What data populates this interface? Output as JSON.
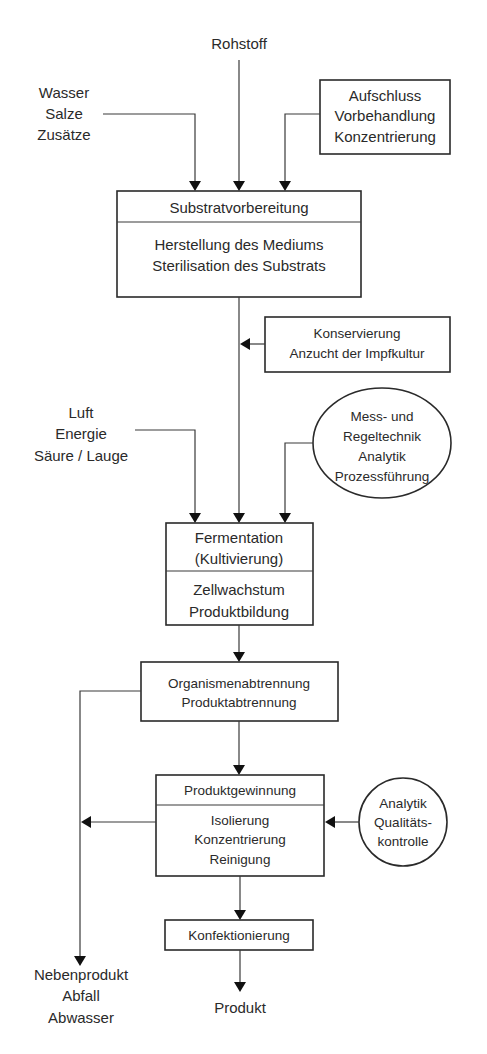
{
  "diagram": {
    "type": "process-flowchart",
    "colors": {
      "line": "#3a3a3a",
      "text": "#2a2a2a",
      "arrowhead": "#111111",
      "background": "#ffffff"
    },
    "inputs": {
      "rohstoff": "Rohstoff",
      "wasser_group": {
        "lines": [
          "Wasser",
          "Salze",
          "Zusätze"
        ]
      },
      "luft_group": {
        "lines": [
          "Luft",
          "Energie",
          "Säure / Lauge"
        ]
      }
    },
    "aufschluss_box": {
      "lines": [
        "Aufschluss",
        "Vorbehandlung",
        "Konzentrierung"
      ]
    },
    "substrat_box": {
      "header": "Substratvorbereitung",
      "lines": [
        "Herstellung des Mediums",
        "Sterilisation des Substrats"
      ]
    },
    "konservierung_box": {
      "lines": [
        "Konservierung",
        "Anzucht der Impfkultur"
      ]
    },
    "mess_ellipse": {
      "lines": [
        "Mess- und",
        "Regeltechnik",
        "Analytik",
        "Prozessführung"
      ]
    },
    "fermentation_box": {
      "header_lines": [
        "Fermentation",
        "(Kultivierung)"
      ],
      "lines": [
        "Zellwachstum",
        "Produktbildung"
      ]
    },
    "abtrennung_box": {
      "lines": [
        "Organismenabtrennung",
        "Produktabtrennung"
      ]
    },
    "gewinnung_box": {
      "header": "Produktgewinnung",
      "lines": [
        "Isolierung",
        "Konzentrierung",
        "Reinigung"
      ]
    },
    "analytik_circle": {
      "lines": [
        "Analytik",
        "Qualitäts-",
        "kontrolle"
      ]
    },
    "konfektionierung_box": {
      "label": "Konfektionierung"
    },
    "outputs": {
      "produkt": "Produkt",
      "neben_group": {
        "lines": [
          "Nebenprodukt",
          "Abfall",
          "Abwasser"
        ]
      }
    }
  }
}
